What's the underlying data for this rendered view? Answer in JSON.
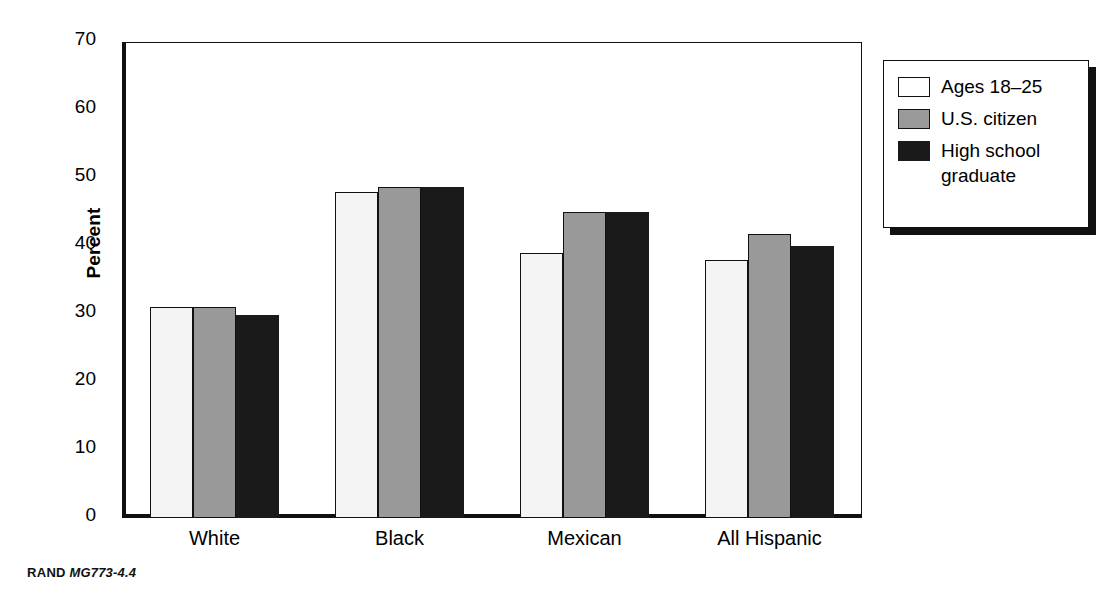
{
  "figure": {
    "footer_brand": "RAND",
    "footer_number": "MG773-4.4"
  },
  "legend": {
    "items": [
      {
        "label": "Ages 18–25",
        "color": "#ffffff"
      },
      {
        "label": "U.S. citizen",
        "color": "#9a9a9a"
      },
      {
        "label": "High school\ngraduate",
        "color": "#1a1a1a"
      }
    ]
  },
  "axes": {
    "y_title": "Percent",
    "y_ticks": [
      "0",
      "10",
      "20",
      "30",
      "40",
      "50",
      "60",
      "70"
    ]
  },
  "chart_data": {
    "type": "bar",
    "title": "",
    "xlabel": "",
    "ylabel": "Percent",
    "ylim": [
      0,
      70
    ],
    "ytick_step": 10,
    "grid": false,
    "legend_position": "top-right-outside",
    "categories": [
      "White",
      "Black",
      "Mexican",
      "All Hispanic"
    ],
    "series": [
      {
        "name": "Ages 18–25",
        "color": "#f4f4f4",
        "values": [
          31,
          48,
          39,
          38
        ]
      },
      {
        "name": "U.S. citizen",
        "color": "#999999",
        "values": [
          31,
          48.7,
          45,
          41.7
        ]
      },
      {
        "name": "High school graduate",
        "color": "#1a1a1a",
        "values": [
          29.9,
          48.7,
          45,
          40
        ]
      }
    ]
  }
}
